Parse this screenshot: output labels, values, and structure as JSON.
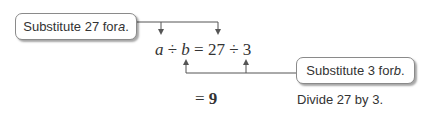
{
  "callouts": [
    {
      "text_before": "Substitute 27 for ",
      "variable": "a",
      "text_after": "."
    },
    {
      "text_before": "Substitute 3 for ",
      "variable": "b",
      "text_after": "."
    }
  ],
  "equation": {
    "var_a": "a",
    "op1": "÷",
    "var_b": "b",
    "eq": "=",
    "num1": "27",
    "op2": "÷",
    "num2": "3"
  },
  "result": {
    "eq": "=",
    "value": "9"
  },
  "step_note": "Divide 27 by 3.",
  "colors": {
    "text": "#333333",
    "line": "#555555",
    "bubble_border": "#8a8a8a"
  }
}
